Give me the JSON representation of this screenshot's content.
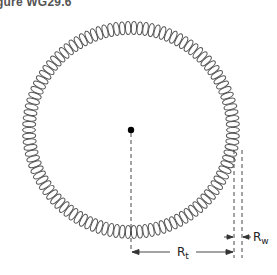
{
  "figure": {
    "title_visible": "gure WG29.6",
    "labels": {
      "toroid_radius": {
        "main": "R",
        "sub": "t"
      },
      "wire_radius": {
        "main": "R",
        "sub": "w"
      }
    },
    "colors": {
      "coil": "#555555",
      "lines": "#333333",
      "background": "#ffffff"
    },
    "geometry": {
      "center": [
        131,
        130
      ],
      "coil_radius": 102,
      "coil_loops": 110
    }
  }
}
